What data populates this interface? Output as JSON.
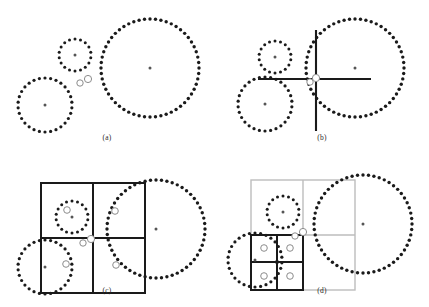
{
  "figure": {
    "type": "multi-panel-diagram",
    "panel_count": 4,
    "layout": "2x2",
    "width": 429,
    "height": 307,
    "background": "#ffffff"
  },
  "colors": {
    "dot_black": "#1a1a1a",
    "grid_dark": "#1a1a1a",
    "grid_light": "#bdbdbd",
    "marker_gray": "#8c8c8c",
    "marker_fill": "#ffffff",
    "center_dot": "#555555",
    "label_text": "#2b2b2b",
    "axis_line": "#1a1a1a"
  },
  "panels": [
    {
      "id": "a",
      "label": "(a)",
      "description": "Three dotted circles with two query point markers between them",
      "circles": [
        {
          "name": "small-circle",
          "cx": 75,
          "cy": 55,
          "r": 16,
          "dots": 18,
          "dot_r": 1.5
        },
        {
          "name": "medium-circle",
          "cx": 45,
          "cy": 105,
          "r": 27,
          "dots": 30,
          "dot_r": 1.6
        },
        {
          "name": "large-circle",
          "cx": 150,
          "cy": 68,
          "r": 49,
          "dots": 56,
          "dot_r": 1.7
        }
      ],
      "centers": [
        {
          "cx": 75,
          "cy": 55
        },
        {
          "cx": 45,
          "cy": 105
        },
        {
          "cx": 150,
          "cy": 68
        }
      ],
      "markers": [
        {
          "name": "query-marker-1",
          "cx": 80,
          "cy": 83,
          "r": 3.2
        },
        {
          "name": "query-marker-2",
          "cx": 88,
          "cy": 79,
          "r": 3.6
        }
      ],
      "grid": null,
      "axes": null
    },
    {
      "id": "b",
      "label": "(b)",
      "description": "Same circles with a crosshair axis pair centered on the query point",
      "circles": [
        {
          "name": "small-circle",
          "cx": 60,
          "cy": 57,
          "r": 16,
          "dots": 18,
          "dot_r": 1.5
        },
        {
          "name": "medium-circle",
          "cx": 50,
          "cy": 104,
          "r": 27,
          "dots": 30,
          "dot_r": 1.6
        },
        {
          "name": "large-circle",
          "cx": 140,
          "cy": 68,
          "r": 49,
          "dots": 56,
          "dot_r": 1.7
        }
      ],
      "centers": [
        {
          "cx": 60,
          "cy": 57
        },
        {
          "cx": 50,
          "cy": 104
        },
        {
          "cx": 140,
          "cy": 68
        }
      ],
      "markers": [
        {
          "name": "query-marker-1",
          "cx": 95,
          "cy": 82,
          "r": 3.2
        },
        {
          "name": "query-marker-2",
          "cx": 101,
          "cy": 78,
          "r": 3.6
        }
      ],
      "axes": {
        "vertical": {
          "x": 101,
          "y1": 30,
          "y2": 131
        },
        "horizontal": {
          "y": 79,
          "x1": 43,
          "x2": 156
        },
        "stroke_width": 2.1
      },
      "grid": null
    },
    {
      "id": "c",
      "label": "(c)",
      "description": "Quadtree root cell split into four quadrants, one marker per quadrant",
      "circles": [
        {
          "name": "small-circle",
          "cx": 72,
          "cy": 63,
          "r": 16,
          "dots": 18,
          "dot_r": 1.5
        },
        {
          "name": "medium-circle",
          "cx": 45,
          "cy": 113,
          "r": 27,
          "dots": 30,
          "dot_r": 1.6
        },
        {
          "name": "large-circle",
          "cx": 156,
          "cy": 75,
          "r": 49,
          "dots": 56,
          "dot_r": 1.7
        }
      ],
      "centers": [
        {
          "cx": 72,
          "cy": 63
        },
        {
          "cx": 45,
          "cy": 113
        },
        {
          "cx": 156,
          "cy": 75
        }
      ],
      "markers": [
        {
          "name": "query-marker-1",
          "cx": 83,
          "cy": 89,
          "r": 3.2
        },
        {
          "name": "query-marker-2",
          "cx": 91,
          "cy": 85,
          "r": 3.6
        }
      ],
      "grid": {
        "style": "dark",
        "x": 41,
        "y": 29,
        "w": 104,
        "h": 110,
        "split_x": 93,
        "split_y": 84,
        "stroke_width": 2.0,
        "quadrant_markers": [
          {
            "name": "quadrant-marker-nw",
            "cx": 67,
            "cy": 56,
            "r": 3.3
          },
          {
            "name": "quadrant-marker-ne",
            "cx": 115,
            "cy": 57,
            "r": 3.3
          },
          {
            "name": "quadrant-marker-sw",
            "cx": 66,
            "cy": 110,
            "r": 3.3
          },
          {
            "name": "quadrant-marker-se",
            "cx": 116,
            "cy": 111,
            "r": 3.3
          }
        ]
      },
      "axes": null
    },
    {
      "id": "d",
      "label": "(d)",
      "description": "Recursive subdivision: bottom-left quadrant split again into four dark sub-cells",
      "circles": [
        {
          "name": "small-circle",
          "cx": 68,
          "cy": 58,
          "r": 16,
          "dots": 18,
          "dot_r": 1.5
        },
        {
          "name": "medium-circle",
          "cx": 40,
          "cy": 106,
          "r": 27,
          "dots": 30,
          "dot_r": 1.6
        },
        {
          "name": "large-circle",
          "cx": 148,
          "cy": 70,
          "r": 49,
          "dots": 56,
          "dot_r": 1.7
        }
      ],
      "centers": [
        {
          "cx": 68,
          "cy": 58
        },
        {
          "cx": 40,
          "cy": 106
        },
        {
          "cx": 148,
          "cy": 70
        }
      ],
      "markers": [
        {
          "name": "query-marker-1",
          "cx": 80,
          "cy": 82,
          "r": 3.2
        },
        {
          "name": "query-marker-2",
          "cx": 88,
          "cy": 78,
          "r": 3.6
        }
      ],
      "grid": {
        "style": "light",
        "x": 36,
        "y": 26,
        "w": 104,
        "h": 110,
        "split_x": 88,
        "split_y": 81,
        "stroke_width": 1.4
      },
      "subgrid": {
        "style": "dark",
        "x": 36,
        "y": 81,
        "w": 52,
        "h": 55,
        "split_x": 62,
        "split_y": 108,
        "stroke_width": 2.0,
        "cell_markers": [
          {
            "name": "subcell-marker-nw",
            "cx": 49,
            "cy": 94,
            "r": 3.3
          },
          {
            "name": "subcell-marker-ne",
            "cx": 75,
            "cy": 94,
            "r": 3.3
          },
          {
            "name": "subcell-marker-sw",
            "cx": 49,
            "cy": 122,
            "r": 3.3
          },
          {
            "name": "subcell-marker-se",
            "cx": 75,
            "cy": 122,
            "r": 3.3
          }
        ],
        "corner_dot": {
          "name": "subgrid-corner-dot",
          "cx": 62,
          "cy": 108,
          "r": 2.0
        }
      },
      "axes": null
    }
  ]
}
